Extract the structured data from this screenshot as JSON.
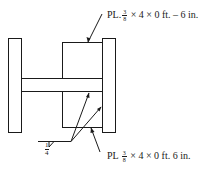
{
  "diagram": {
    "type": "welded I-section with cover plates",
    "top_label": {
      "prefix": "PL",
      "frac_num": "3",
      "frac_den": "8",
      "suffix": "× 4 × 0 ft. – 6 in."
    },
    "bottom_label": {
      "prefix": "PL",
      "frac_num": "3",
      "frac_den": "8",
      "suffix": "× 4 × 0 ft. 6 in."
    },
    "weld_symbol": {
      "size_num": "1",
      "size_den": "4",
      "type": "fillet"
    },
    "colors": {
      "line": "#1a1a1a",
      "background": "#ffffff"
    }
  }
}
